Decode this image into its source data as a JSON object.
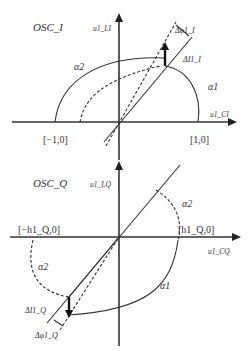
{
  "top_panel": {
    "title": "OSC_I",
    "y_axis_label": "u1_LI",
    "x_axis_label": "u1_CI",
    "point_left": "[−1,0]",
    "point_right": "[1,0]",
    "curve_alpha2": "α2",
    "curve_alpha1": "α1",
    "delta_phi": "Δφ1_I",
    "delta_I": "ΔI1_I"
  },
  "bottom_panel": {
    "title": "OSC_Q",
    "y_axis_label": "u1_LQ",
    "x_axis_label": "u1_CQ",
    "point_left": "[−h1_Q,0]",
    "point_right": "[h1_Q,0]",
    "curve_alpha2_right": "α2",
    "curve_alpha2_left": "α2",
    "curve_alpha1": "α1",
    "delta_I": "ΔI1_Q",
    "delta_phi": "Δφ1_Q"
  },
  "colors": {
    "line": "#333333",
    "background": "#ffffff"
  }
}
